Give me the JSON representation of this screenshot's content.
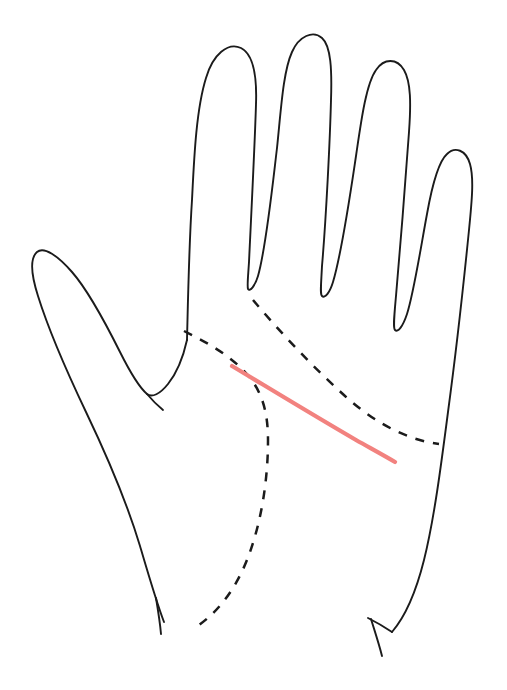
{
  "document": {
    "title": "Palm line diagram",
    "subject": "open right hand, palm view, line drawing",
    "background_color": "#ffffff",
    "width": 507,
    "height": 690,
    "caption": ""
  },
  "palette": {
    "ink": "#1b1b1b",
    "highlight": "#f2827f",
    "paper": "#ffffff"
  },
  "figure": {
    "style": "hand-drawn contour line art",
    "stroke_width_outline": 1.9,
    "stroke_width_dashed": 2.5,
    "stroke_width_highlight": 4.2,
    "dash_pattern": "9 9"
  },
  "parts": [
    {
      "name": "hand-outline",
      "label": "Hand outline",
      "kind": "solid-contour",
      "color": "#1b1b1b",
      "path": "M 187 340 C 188 300 189 245 192 200 C 194 160 196 110 206 78 C 213 54 228 42 241 48 C 253 54 257 76 256 104 C 255 140 251 220 249 262 C 248 278 247 286 248 289 C 250 292 255 286 258 276 C 266 248 272 190 277 148 C 281 110 283 72 292 52 C 299 36 313 30 322 38 C 331 46 332 70 331 100 C 330 140 326 220 322 266 C 321 286 320 294 322 296 C 325 299 330 292 333 282 C 342 252 350 196 356 156 C 361 122 366 84 376 70 C 384 58 397 58 404 70 C 411 82 411 104 409 132 C 406 176 400 250 396 296 C 394 318 393 328 395 330 C 398 333 403 326 407 314 C 414 292 421 246 427 214 C 432 186 438 162 447 154 C 455 146 466 150 470 164 C 474 178 472 200 469 230 C 464 280 455 360 448 412 C 441 466 434 520 424 560 C 415 596 404 618 392 632"
    },
    {
      "name": "thumb-and-wrist-contour",
      "label": "Thumb and left wrist contour",
      "kind": "solid-contour",
      "color": "#1b1b1b",
      "path": "M 187 340 C 183 358 176 374 168 384 C 160 394 152 398 147 394 C 140 388 130 372 120 352 C 104 320 86 288 72 272 C 58 256 44 246 37 252 C 30 258 31 274 38 296 C 48 328 66 370 86 412 C 108 458 128 506 140 546 C 150 580 157 604 164 622"
    },
    {
      "name": "thumb-inner-edge",
      "label": "Thumb inner edge",
      "kind": "solid-contour",
      "color": "#1b1b1b",
      "path": "M 147 394 C 152 400 158 406 163 410"
    },
    {
      "name": "left-wrist-crease-tick",
      "label": "Left wrist crease tick",
      "kind": "solid-contour",
      "color": "#1b1b1b",
      "path": "M 156 598 C 158 610 160 622 161 634"
    },
    {
      "name": "right-wrist-crease-tick",
      "label": "Right wrist crease tick",
      "kind": "solid-contour",
      "color": "#1b1b1b",
      "path": "M 371 619 C 375 632 379 644 382 656"
    },
    {
      "name": "right-wrist-outer-tick",
      "label": "Right wrist outer tick",
      "kind": "solid-contour",
      "color": "#1b1b1b",
      "path": "M 392 632 C 386 628 378 623 368 618"
    },
    {
      "name": "thenar-crease",
      "label": "Thenar eminence crease (dashed)",
      "kind": "dashed-crease",
      "color": "#1b1b1b",
      "path": "M 184 331 C 206 342 228 354 245 372 C 262 390 268 412 268 440 C 268 478 262 518 250 552 C 238 586 220 610 199 625"
    },
    {
      "name": "distal-palmar-crease",
      "label": "Distal palmar crease (dashed)",
      "kind": "dashed-crease",
      "color": "#1b1b1b",
      "path": "M 253 300 C 280 332 312 366 345 396 C 376 424 408 440 439 444"
    },
    {
      "name": "marked-crease-segment",
      "label": "Highlighted crease segment",
      "kind": "highlight",
      "color": "#f2827f",
      "path": "M 232 366 C 272 390 318 418 356 440 C 372 449 385 456 395 462"
    }
  ],
  "annotations": {
    "highlight_start_point": {
      "x": 232,
      "y": 366
    },
    "highlight_end_point": {
      "x": 395,
      "y": 462
    },
    "highlight_color_hex": "#f2827f"
  }
}
